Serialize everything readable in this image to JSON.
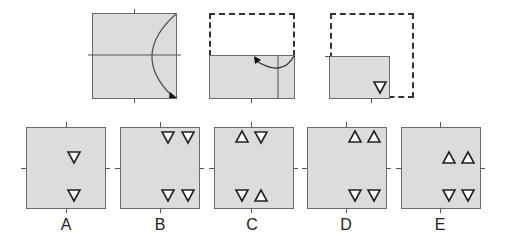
{
  "question": {
    "steps": [
      {
        "id": "step-1",
        "description": "Square paper with horizontal midline; bottom-right corner folded up along a curved arrow to top-right"
      },
      {
        "id": "step-2",
        "description": "Top half folded down (dashed outline shows original top); right strip folded left with arrow"
      },
      {
        "id": "step-3",
        "description": "Folded paper with a downward-pointing triangle punched near bottom-right corner"
      }
    ],
    "punch_shape": "downward-triangle"
  },
  "options": [
    {
      "label": "A",
      "triangles": [
        {
          "pos": "middle-right",
          "dir": "down"
        },
        {
          "pos": "bottom-center-right",
          "dir": "down"
        }
      ]
    },
    {
      "label": "B",
      "triangles": [
        {
          "pos": "top-right-1",
          "dir": "down"
        },
        {
          "pos": "top-right-2",
          "dir": "down"
        },
        {
          "pos": "bottom-right-1",
          "dir": "down"
        },
        {
          "pos": "bottom-right-2",
          "dir": "down"
        }
      ]
    },
    {
      "label": "C",
      "triangles": [
        {
          "pos": "top-1",
          "dir": "up"
        },
        {
          "pos": "top-2",
          "dir": "down"
        },
        {
          "pos": "bottom-1",
          "dir": "down"
        },
        {
          "pos": "bottom-2",
          "dir": "up"
        }
      ]
    },
    {
      "label": "D",
      "triangles": [
        {
          "pos": "top-right-1",
          "dir": "up"
        },
        {
          "pos": "top-right-2",
          "dir": "up"
        },
        {
          "pos": "bottom-right-1",
          "dir": "down"
        },
        {
          "pos": "bottom-right-2",
          "dir": "down"
        }
      ]
    },
    {
      "label": "E",
      "triangles": [
        {
          "pos": "middle-right-1",
          "dir": "up"
        },
        {
          "pos": "middle-right-2",
          "dir": "up"
        },
        {
          "pos": "bottom-right-1",
          "dir": "down"
        },
        {
          "pos": "bottom-right-2",
          "dir": "down"
        }
      ]
    }
  ],
  "colors": {
    "paper": "#dcdcdc",
    "border": "#6a6a6a",
    "ink": "#222222"
  }
}
